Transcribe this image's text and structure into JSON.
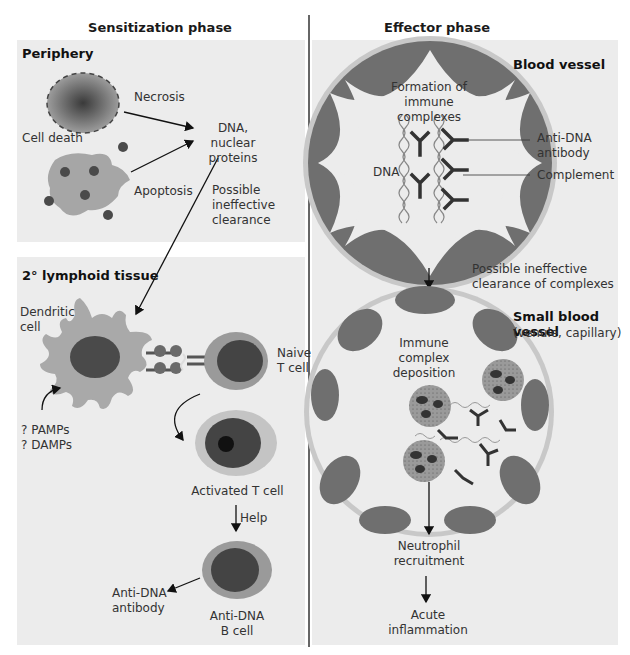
{
  "figure": {
    "colors": {
      "panel_bg": "#ececec",
      "cell_body": "#a9a9a9",
      "cell_outer_ring": "#9a9a9a",
      "nucleus": "#4a4a4a",
      "activated_ring": "#c4c4c4",
      "vessel_wall": "#c8c8c8",
      "endothelium": "#6f6f6f",
      "antibody": "#3a3a3a",
      "divider": "#555555"
    }
  },
  "left": {
    "phase_title": "Sensitization phase",
    "periphery": {
      "title": "Periphery",
      "necrosis": "Necrosis",
      "cell_death": "Cell death",
      "apoptosis": "Apoptosis",
      "dna_line1": "DNA, nuclear",
      "dna_line2": "proteins",
      "clearance_line1": "Possible",
      "clearance_line2": "ineffective",
      "clearance_line3": "clearance"
    },
    "lymphoid": {
      "title": "2° lymphoid tissue",
      "dendritic_line1": "Dendritic",
      "dendritic_line2": "cell",
      "naive_line1": "Naive",
      "naive_line2": "T cell",
      "pamps": "? PAMPs",
      "damps": "? DAMPs",
      "activated": "Activated T cell",
      "help": "Help",
      "antibody_line1": "Anti-DNA",
      "antibody_line2": "antibody",
      "bcell_line1": "Anti-DNA",
      "bcell_line2": "B cell"
    }
  },
  "right": {
    "phase_title": "Effector phase",
    "blood_vessel": {
      "title": "Blood vessel",
      "formation_line1": "Formation of",
      "formation_line2": "immune complexes",
      "dna": "DNA",
      "antibody_line1": "Anti-DNA",
      "antibody_line2": "antibody",
      "complement": "Complement"
    },
    "clearance_line1": "Possible ineffective",
    "clearance_line2": "clearance of complexes",
    "small_vessel": {
      "title": "Small blood vessel",
      "subtitle": "(venule, capillary)",
      "deposition_line1": "Immune complex",
      "deposition_line2": "deposition"
    },
    "neutrophil_line1": "Neutrophil",
    "neutrophil_line2": "recruitment",
    "inflammation_line1": "Acute",
    "inflammation_line2": "inflammation"
  }
}
